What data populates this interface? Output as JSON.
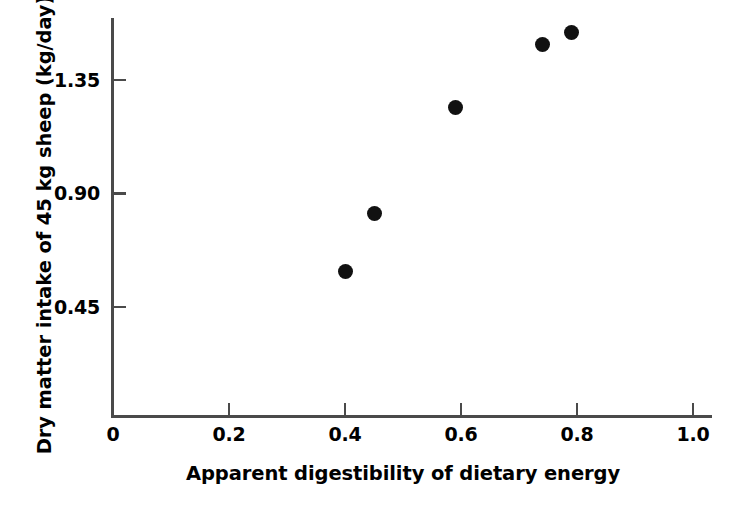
{
  "chart_data": {
    "type": "scatter",
    "title": "",
    "xlabel": "Apparent digestibility of dietary energy",
    "ylabel": "Dry matter intake of 45 kg sheep (kg/day)",
    "xlim": [
      0,
      1.035
    ],
    "ylim": [
      0,
      1.62
    ],
    "xticks": [
      "0",
      "0.2",
      "0.4",
      "0.6",
      "0.8",
      "1.0"
    ],
    "xtick_values": [
      0,
      0.2,
      0.4,
      0.6,
      0.8,
      1.0
    ],
    "yticks": [
      "0.45",
      "0.90",
      "1.35"
    ],
    "ytick_values": [
      0.45,
      0.9,
      1.35
    ],
    "grid": false,
    "legend": "none",
    "marker": {
      "shape": "circle",
      "color": "#111111",
      "size_px": 15
    },
    "axis_color": "#4a4a4a",
    "points": [
      {
        "x": 0.4,
        "y": 0.59
      },
      {
        "x": 0.45,
        "y": 0.82
      },
      {
        "x": 0.59,
        "y": 1.24
      },
      {
        "x": 0.74,
        "y": 1.49
      },
      {
        "x": 0.79,
        "y": 1.54
      }
    ],
    "series": [
      {
        "name": "Dry matter intake vs apparent digestibility",
        "x": [
          0.4,
          0.45,
          0.59,
          0.74,
          0.79
        ],
        "values": [
          0.59,
          0.82,
          1.24,
          1.49,
          1.54
        ]
      }
    ]
  }
}
